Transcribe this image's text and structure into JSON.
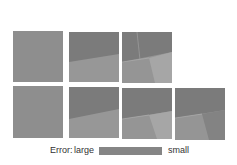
{
  "figure": {
    "rows": [
      {
        "panels": [
          {
            "id": "r1p1",
            "regions": 1
          },
          {
            "id": "r1p2",
            "regions": 2
          },
          {
            "id": "r1p3",
            "regions": 4
          }
        ]
      },
      {
        "panels": [
          {
            "id": "r2p1",
            "regions": 1
          },
          {
            "id": "r2p2",
            "regions": 2
          },
          {
            "id": "r2p3",
            "regions": 3
          },
          {
            "id": "r2p4",
            "regions": 3
          }
        ]
      }
    ],
    "colors": {
      "uniform": "#8e8e8e",
      "dark": "#7a7a7a",
      "mid": "#959595",
      "light": "#a3a3a3",
      "darker": "#868686"
    }
  },
  "legend": {
    "label": "Error:",
    "low_label": "large",
    "high_label": "small",
    "bar_color": "#858585"
  }
}
